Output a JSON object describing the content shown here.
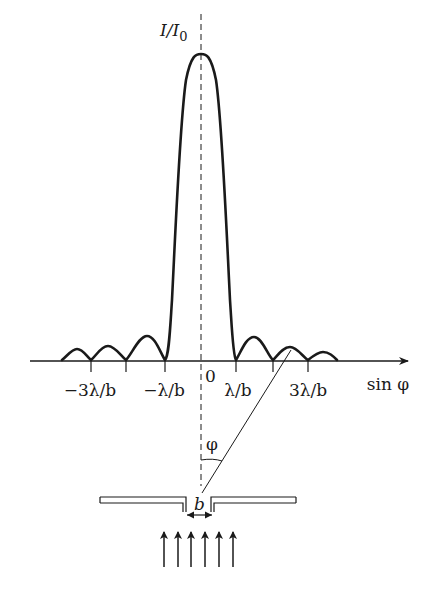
{
  "diagram": {
    "y_axis_label": "I/I₀",
    "y_axis_label_parts": {
      "main": "I/I",
      "sub": "0"
    },
    "x_axis_label": "sin φ",
    "origin_label": "0",
    "tick_labels": [
      {
        "text": "−3λ/b",
        "value": -3
      },
      {
        "text": "−λ/b",
        "value": -1
      },
      {
        "text": "λ/b",
        "value": 1
      },
      {
        "text": "3λ/b",
        "value": 3
      }
    ],
    "angle_label": "φ",
    "slit_width_label": "b",
    "incident_arrows_count": 6,
    "colors": {
      "stroke": "#1a1a1a",
      "background": "#ffffff"
    }
  },
  "labels": {
    "y_axis": "I/I",
    "y_axis_sub": "0",
    "x_axis": "sin φ",
    "origin": "0",
    "tick_m3": "−3λ/b",
    "tick_m1": "−λ/b",
    "tick_p1": "λ/b",
    "tick_p3": "3λ/b",
    "angle": "φ",
    "slit_width": "b"
  }
}
